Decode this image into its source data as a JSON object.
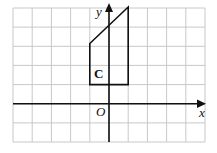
{
  "figure": {
    "type": "coordinate-grid-diagram",
    "grid": {
      "columns": 10,
      "rows": 7,
      "line_color": "#c8c8c8",
      "x_lines_px": [
        13,
        32.2,
        51.4,
        70.6,
        89.8,
        109,
        128.2,
        147.4,
        166.6,
        185.8,
        205
      ],
      "y_lines_px": [
        8,
        27.1,
        46.3,
        65.4,
        84.6,
        103.7,
        122.9,
        142
      ]
    },
    "axes": {
      "x_label": "x",
      "y_label": "y",
      "origin_label": "O",
      "color": "#111111"
    },
    "shape": {
      "label": "C",
      "description": "quadrilateral with slanted top edge",
      "vertices_grid_units": [
        [
          -1,
          1
        ],
        [
          1,
          1
        ],
        [
          1,
          5
        ],
        [
          -1,
          3.5
        ]
      ],
      "stroke_color": "#111111"
    }
  }
}
